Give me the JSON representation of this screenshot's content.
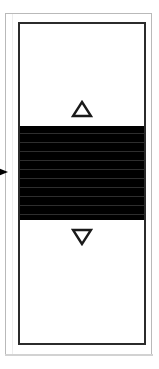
{
  "widget": {
    "name": "vertical-scrollbar",
    "orientation": "vertical",
    "title": "Vertical scrollbar",
    "state_label": "thumb selected",
    "track_label": "Scroll track",
    "upper_track_label": "Page up region",
    "lower_track_label": "Page down region"
  },
  "buttons": {
    "scroll_up": {
      "label": "Scroll up",
      "icon": "triangle-up-icon",
      "glyph": "△",
      "style": "outlined"
    },
    "scroll_down": {
      "label": "Scroll down",
      "icon": "triangle-down-icon",
      "glyph": "▽",
      "style": "outlined"
    }
  },
  "thumb": {
    "label": "Scrollbar thumb",
    "pattern": "horizontal-stripes",
    "stripe_count": 11,
    "selected": true
  },
  "cursor": {
    "label": "Mouse pointer",
    "icon": "pointer-arrow-icon",
    "direction": "right",
    "glyph": "▶"
  },
  "frame": {
    "label": "Panel frame"
  },
  "colors": {
    "thumb_fill": "#000000",
    "stripe": "#2e2e2e",
    "track_fill": "#ffffff",
    "border": "#2b2b2b",
    "outer_frame": "#b9b9b9",
    "arrow_stroke": "#1a1a1a",
    "cursor": "#000000"
  }
}
